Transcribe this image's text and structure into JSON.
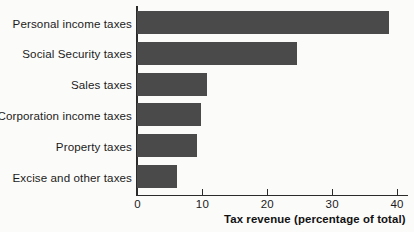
{
  "chart_data": {
    "type": "bar",
    "orientation": "horizontal",
    "title": "",
    "xlabel": "Tax revenue (percentage of total)",
    "ylabel": "",
    "categories": [
      "Personal income taxes",
      "Social Security taxes",
      "Sales taxes",
      "Corporation income taxes",
      "Property taxes",
      "Excise and other taxes"
    ],
    "values": [
      38.8,
      24.6,
      10.8,
      9.9,
      9.2,
      6.1
    ],
    "xlim": [
      0,
      42
    ],
    "xticks": [
      0,
      10,
      20,
      30,
      40
    ],
    "xtick_labels": [
      "0",
      "10",
      "20",
      "30",
      "40"
    ],
    "grid": false,
    "legend": false,
    "bar_color": "#4a4a4a",
    "axis_color": "#2b2b2b",
    "background_color": "#fbfbfa"
  },
  "axis": {
    "x_title": "Tax revenue (percentage of total)"
  }
}
